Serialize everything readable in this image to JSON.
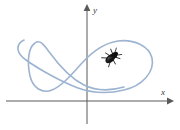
{
  "figure": {
    "name": "parametric-curve-with-bug",
    "background_color": "#ffffff",
    "width": 180,
    "height": 130
  },
  "axes": {
    "color": "#595959",
    "line_width": 1,
    "x_axis": {
      "label": "x",
      "label_position": {
        "x": 163,
        "y": 93
      },
      "start": {
        "x": 6,
        "y": 101
      },
      "end": {
        "x": 172,
        "y": 101
      },
      "arrow": "right"
    },
    "y_axis": {
      "label": "y",
      "label_position": {
        "x": 93,
        "y": 12
      },
      "start": {
        "x": 87,
        "y": 124
      },
      "end": {
        "x": 87,
        "y": 7
      },
      "arrow": "up"
    },
    "origin": {
      "x": 87,
      "y": 101
    }
  },
  "curve": {
    "name": "parametric-curve",
    "color": "#9db4d0",
    "line_width": 1.6,
    "description": "Smooth closed parametric curve with a narrow cusp-like loop at the left, a self-intersection near the origin, and a large rounded loop at the right.",
    "path": "M 24 40 C 16 44 15 52 26 60 C 40 70 62 82 78 88 C 92 93 108 94 124 90 C 142 86 155 72 152 58 C 149 46 134 39 118 41 C 104 43 92 52 82 63 C 72 74 62 86 52 90 C 42 94 33 88 30 76 C 27 62 28 48 35 43 C 40 39 44 45 50 53 C 58 64 70 78 84 85 C 96 91 110 91 124 87",
    "self_intersection": {
      "x": 84,
      "y": 86
    },
    "left_cusp": {
      "x": 18,
      "y": 47
    },
    "right_extreme": {
      "x": 154,
      "y": 60
    }
  },
  "bug": {
    "name": "beetle",
    "body_color": "#1a1a1a",
    "leg_color": "#333333",
    "position": {
      "x": 111,
      "y": 58
    },
    "rotation_deg": -40,
    "length": 15,
    "width": 8,
    "description": "Small black beetle crawling along the curve in the upper right quadrant"
  }
}
